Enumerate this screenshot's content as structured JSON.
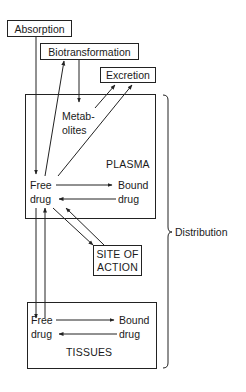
{
  "diagram": {
    "nodes": {
      "absorption": "Absorption",
      "biotransformation": "Biotransformation",
      "excretion": "Excretion",
      "metabolites_line1": "Metab-",
      "metabolites_line2": "olites",
      "plasma": "PLASMA",
      "plasma_free_line1": "Free",
      "plasma_free_line2": "drug",
      "plasma_bound_line1": "Bound",
      "plasma_bound_line2": "drug",
      "site_line1": "SITE OF",
      "site_line2": "ACTION",
      "tissues": "TISSUES",
      "tissues_free_line1": "Free",
      "tissues_free_line2": "drug",
      "tissues_bound_line1": "Bound",
      "tissues_bound_line2": "drug",
      "distribution": "Distribution"
    },
    "edges": [
      {
        "from": "Absorption",
        "to": "Free drug (plasma)"
      },
      {
        "from": "Free drug (plasma)",
        "to": "Biotransformation"
      },
      {
        "from": "Biotransformation",
        "to": "Metabolites"
      },
      {
        "from": "Metabolites",
        "to": "Excretion"
      },
      {
        "from": "Free drug (plasma)",
        "to": "Excretion"
      },
      {
        "from": "Free drug (plasma)",
        "to": "Bound drug (plasma)"
      },
      {
        "from": "Bound drug (plasma)",
        "to": "Free drug (plasma)"
      },
      {
        "from": "Free drug (plasma)",
        "to": "Site of action"
      },
      {
        "from": "Site of action",
        "to": "Free drug (plasma)"
      },
      {
        "from": "Free drug (plasma)",
        "to": "Free drug (tissues)"
      },
      {
        "from": "Free drug (tissues)",
        "to": "Free drug (plasma)"
      },
      {
        "from": "Free drug (tissues)",
        "to": "Bound drug (tissues)"
      },
      {
        "from": "Bound drug (tissues)",
        "to": "Free drug (tissues)"
      }
    ],
    "brace_label": "Distribution"
  }
}
